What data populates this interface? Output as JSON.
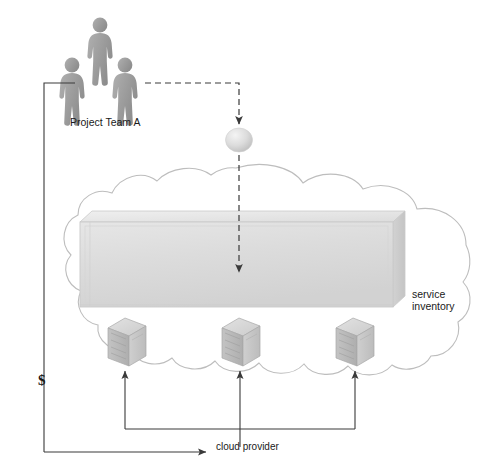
{
  "diagram": {
    "type": "architecture-diagram",
    "labels": {
      "project_team": "Project Team A",
      "service_inventory": "service\ninventory",
      "cloud_provider": "cloud provider",
      "cost_symbol": "$"
    },
    "actors": {
      "name": "Project Team A",
      "count": 3,
      "icon": "person-figure",
      "color": "#9a9a9a"
    },
    "service_node": {
      "icon": "sphere",
      "label": "",
      "color": "#d8d8d8"
    },
    "cloud": {
      "name": "cloud-boundary",
      "stroke": "#b9b9b9",
      "fill": "#ffffff"
    },
    "inventory_box": {
      "name": "service-inventory-container",
      "fill": "#dcdcdc",
      "stroke": "#c6c6c6"
    },
    "servers": [
      {
        "id": "server-1",
        "x": 127,
        "y": 340
      },
      {
        "id": "server-2",
        "x": 241,
        "y": 340
      },
      {
        "id": "server-3",
        "x": 355,
        "y": 340
      }
    ],
    "connectors": {
      "deploy_flow": "dashed-arrow-team-to-inventory",
      "provider_flow": "solid-arrows-servers-to-cloud-provider",
      "billing_flow": "solid-arrow-cost-to-team"
    },
    "colors": {
      "line": "#3a3a3a",
      "cloud_stroke": "#bdbdbd",
      "box_fill": "#dedede",
      "icon_gray": "#9c9c9c",
      "text": "#1a1a1a"
    }
  }
}
